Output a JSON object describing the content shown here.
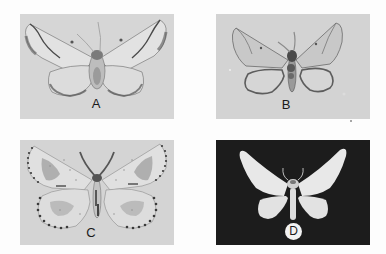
{
  "figure": {
    "panels": [
      {
        "id": "A",
        "label": "A",
        "background": "#d6d6d6",
        "label_style": "plain"
      },
      {
        "id": "B",
        "label": "B",
        "background": "#d3d3d3",
        "label_style": "plain"
      },
      {
        "id": "C",
        "label": "C",
        "background": "#d4d4d4",
        "label_style": "plain"
      },
      {
        "id": "D",
        "label": "D",
        "background": "#1c1c1c",
        "label_style": "circled"
      }
    ]
  },
  "colors": {
    "page": "#fdfdfd",
    "wing_light": "#e4e4e4",
    "wing_shadow": "#8a8a8a",
    "body_dark": "#4a4a4a",
    "moth_white": "#ececec"
  }
}
